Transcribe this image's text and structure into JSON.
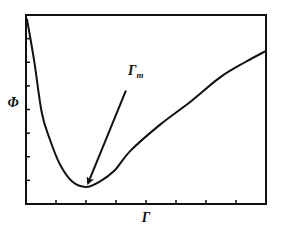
{
  "chart_data": {
    "type": "line",
    "title": "",
    "xlabel": "Γ",
    "ylabel": "Φ",
    "xlim": [
      0,
      8
    ],
    "ylim": [
      0,
      1
    ],
    "x_ticks": [
      1,
      2,
      3,
      4,
      5,
      6,
      7
    ],
    "y_ticks": [
      0.125,
      0.25,
      0.375,
      0.5,
      0.625,
      0.75,
      0.875
    ],
    "x_tick_labels": [],
    "y_tick_labels": [],
    "grid": false,
    "legend": null,
    "series": [
      {
        "name": "Φ(Γ)",
        "color": "#111111",
        "x": [
          0.03,
          0.27,
          0.53,
          0.8,
          1.13,
          1.53,
          2.0,
          2.47,
          2.97,
          3.47,
          4.47,
          5.47,
          6.47,
          7.3,
          8.0
        ],
        "y": [
          0.98,
          0.76,
          0.48,
          0.34,
          0.21,
          0.12,
          0.09,
          0.12,
          0.18,
          0.28,
          0.42,
          0.54,
          0.67,
          0.75,
          0.81
        ]
      }
    ],
    "annotations": [
      {
        "text": "Γ",
        "subscript": "m",
        "type": "arrow",
        "from": [
          3.33,
          0.6
        ],
        "to": [
          2.07,
          0.11
        ],
        "label_at": [
          3.4,
          0.68
        ]
      }
    ]
  }
}
